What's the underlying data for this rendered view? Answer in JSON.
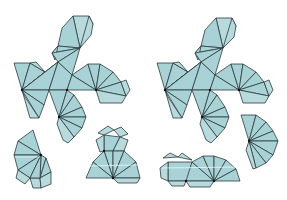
{
  "figure": {
    "colors": {
      "face_fill": "#a9d2d6",
      "tab_fill": "#b8dadd",
      "edge_stroke": "#2b3b3d",
      "vertex_dot": "#111111",
      "background": "#ffffff"
    },
    "nets": [
      {
        "name": "left-net",
        "pieces": [
          {
            "name": "main-piece",
            "marked_vertices": [
              [
                22,
                90
              ],
              [
                67,
                90
              ],
              [
                96,
                90
              ],
              [
                59,
                117
              ]
            ]
          },
          {
            "name": "lower-left-fan",
            "marked_vertices": [
              [
                41,
                155
              ]
            ]
          },
          {
            "name": "lower-right-cluster",
            "marked_vertices": [
              [
                104,
                151
              ],
              [
                113,
                178
              ]
            ]
          }
        ]
      },
      {
        "name": "right-net",
        "pieces": [
          {
            "name": "main-piece",
            "marked_vertices": [
              [
                165,
                90
              ],
              [
                210,
                90
              ],
              [
                239,
                90
              ],
              [
                202,
                117
              ]
            ]
          },
          {
            "name": "right-fan",
            "marked_vertices": [
              [
                249,
                141
              ]
            ]
          },
          {
            "name": "bottom-cluster",
            "marked_vertices": [
              [
                186,
                181
              ],
              [
                214,
                181
              ]
            ]
          }
        ]
      }
    ]
  }
}
